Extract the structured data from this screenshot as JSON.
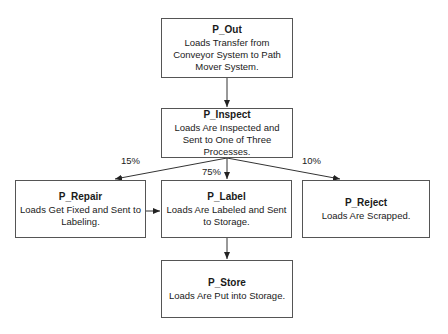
{
  "nodes": {
    "out": {
      "title": "P_Out",
      "desc": "Loads Transfer from Conveyor System to Path Mover System."
    },
    "inspect": {
      "title": "P_Inspect",
      "desc": "Loads Are Inspected and Sent to One of Three Processes."
    },
    "repair": {
      "title": "P_Repair",
      "desc": "Loads Get Fixed and Sent to Labeling."
    },
    "label": {
      "title": "P_Label",
      "desc": "Loads Are Labeled and Sent to Storage."
    },
    "reject": {
      "title": "P_Reject",
      "desc": "Loads Are Scrapped."
    },
    "store": {
      "title": "P_Store",
      "desc": "Loads Are Put into Storage."
    }
  },
  "edges": [
    {
      "from": "P_Out",
      "to": "P_Inspect",
      "label": ""
    },
    {
      "from": "P_Inspect",
      "to": "P_Repair",
      "label": "15%"
    },
    {
      "from": "P_Inspect",
      "to": "P_Label",
      "label": "75%"
    },
    {
      "from": "P_Inspect",
      "to": "P_Reject",
      "label": "10%"
    },
    {
      "from": "P_Repair",
      "to": "P_Label",
      "label": ""
    },
    {
      "from": "P_Label",
      "to": "P_Store",
      "label": ""
    }
  ],
  "edge_labels": {
    "repair": "15%",
    "label": "75%",
    "reject": "10%"
  }
}
